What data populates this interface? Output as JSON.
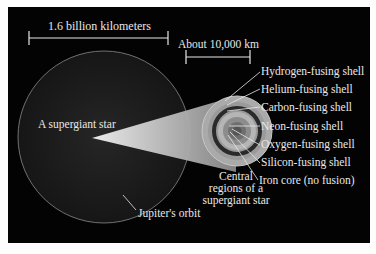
{
  "diagram": {
    "scale_bars": {
      "large": "1.6 billion kilometers",
      "small": "About 10,000 km"
    },
    "labels": {
      "star": "A supergiant star",
      "orbit": "Jupiter's orbit",
      "central_line1": "Central",
      "central_line2": "regions of a",
      "central_line3": "supergiant star"
    },
    "shells": [
      {
        "label": "Hydrogen-fusing shell"
      },
      {
        "label": "Helium-fusing shell"
      },
      {
        "label": "Carbon-fusing shell"
      },
      {
        "label": "Neon-fusing shell"
      },
      {
        "label": "Oxygen-fusing shell"
      },
      {
        "label": "Silicon-fusing shell"
      },
      {
        "label": "Iron core (no fusion)"
      }
    ],
    "colors": {
      "background": "#030303",
      "text": "#e8e8e8",
      "star_fill": "#1c1c1c",
      "orbit": "#8a8a8a"
    }
  }
}
